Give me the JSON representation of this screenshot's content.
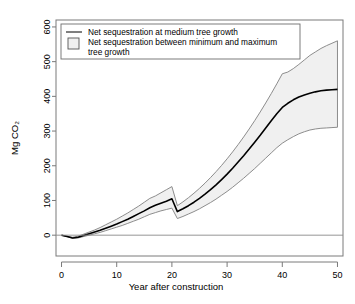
{
  "chart_data": {
    "type": "line",
    "title": "",
    "xlabel": "Year after construction",
    "ylabel": "Mg CO2",
    "ylabel_display": "Mg CO₂",
    "xlim": [
      -1,
      51
    ],
    "ylim": [
      -60,
      620
    ],
    "xticks": [
      0,
      10,
      20,
      30,
      40,
      50
    ],
    "yticks": [
      0,
      100,
      200,
      300,
      400,
      500,
      600
    ],
    "grid": false,
    "zero_reference_line": 0,
    "legend_position": "top-left",
    "legend": [
      {
        "label": "Net sequestration at medium tree growth",
        "marker": "line",
        "color": "#000000"
      },
      {
        "label": "Net sequestration between minimum and maximum tree growth",
        "marker": "square",
        "color": "#f0f0f0"
      }
    ],
    "x": [
      0,
      1,
      2,
      3,
      4,
      5,
      6,
      7,
      8,
      9,
      10,
      11,
      12,
      13,
      14,
      15,
      16,
      17,
      18,
      19,
      20,
      20.99,
      21,
      22,
      23,
      24,
      25,
      26,
      27,
      28,
      29,
      30,
      31,
      32,
      33,
      34,
      35,
      36,
      37,
      38,
      39,
      40,
      41,
      42,
      43,
      44,
      45,
      46,
      47,
      48,
      49,
      50
    ],
    "series": [
      {
        "name": "Maximum tree growth (upper band edge)",
        "values": [
          0,
          -3,
          -6,
          -3,
          3,
          9,
          15,
          22,
          30,
          38,
          46,
          55,
          64,
          74,
          84,
          95,
          106,
          113,
          122,
          131,
          140,
          85,
          85,
          96,
          108,
          121,
          135,
          150,
          166,
          183,
          201,
          220,
          240,
          261,
          283,
          306,
          330,
          355,
          381,
          408,
          436,
          465,
          470,
          480,
          492,
          505,
          518,
          528,
          538,
          546,
          553,
          560
        ]
      },
      {
        "name": "Medium tree growth",
        "values": [
          0,
          -4,
          -8,
          -6,
          -1,
          4,
          9,
          14,
          20,
          26,
          32,
          39,
          46,
          54,
          62,
          70,
          79,
          86,
          92,
          98,
          105,
          68,
          68,
          76,
          85,
          95,
          106,
          118,
          131,
          145,
          160,
          176,
          193,
          211,
          229,
          248,
          268,
          288,
          309,
          330,
          350,
          368,
          380,
          390,
          398,
          404,
          409,
          413,
          416,
          418,
          419,
          420
        ]
      },
      {
        "name": "Minimum tree growth (lower band edge)",
        "values": [
          0,
          -4,
          -9,
          -8,
          -4,
          0,
          4,
          8,
          13,
          18,
          23,
          28,
          34,
          40,
          46,
          53,
          60,
          65,
          70,
          74,
          78,
          48,
          48,
          54,
          61,
          68,
          76,
          85,
          94,
          104,
          115,
          126,
          138,
          151,
          164,
          178,
          192,
          207,
          222,
          237,
          252,
          265,
          275,
          284,
          292,
          298,
          303,
          306,
          308,
          309,
          310,
          311
        ]
      }
    ],
    "annotations": [
      {
        "x": 20,
        "text": "discontinuity: harvest/replacement event at year 20"
      },
      {
        "x": 50,
        "text": "band truncated vertically at year 50"
      }
    ],
    "colors": {
      "line": "#000000",
      "band_fill": "#f0f0f0",
      "band_edge": "#808080",
      "axis": "#7a7a7a",
      "text": "#000000",
      "background": "#ffffff"
    }
  },
  "axis": {
    "x_tick_labels": [
      "0",
      "10",
      "20",
      "30",
      "40",
      "50"
    ],
    "y_tick_labels": [
      "0",
      "100",
      "200",
      "300",
      "400",
      "500",
      "600"
    ],
    "x_title": "Year after construction",
    "y_title": "Mg CO₂"
  },
  "legend": {
    "item1": "Net sequestration at medium tree growth",
    "item2_line1": "Net sequestration between minimum and maximum",
    "item2_line2": "tree growth"
  }
}
